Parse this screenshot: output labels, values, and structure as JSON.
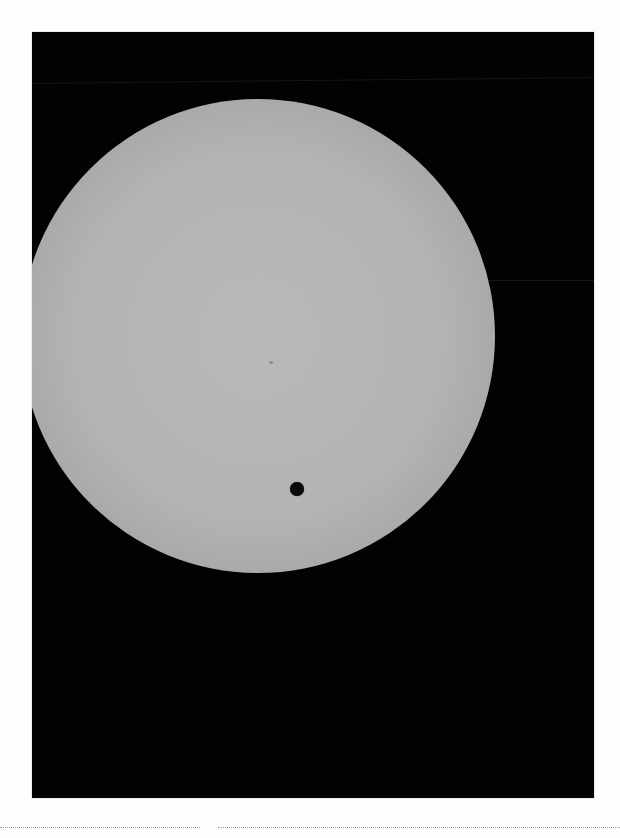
{
  "image": {
    "subject": "Transit of Venus across the Sun",
    "background_color": "#020202",
    "page_color": "#fdfdfd",
    "sun": {
      "center_x": 258,
      "center_y": 336,
      "radius": 237,
      "color": "#b5b5b5"
    },
    "venus": {
      "center_x": 297,
      "center_y": 489,
      "radius": 7,
      "color": "#0a0a0a"
    },
    "sunspot": {
      "x": 270,
      "y": 362
    }
  }
}
